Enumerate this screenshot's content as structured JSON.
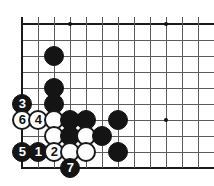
{
  "figure": {
    "kind": "go-board-diagram",
    "title": "",
    "width": 214,
    "height": 186
  },
  "board": {
    "visible_columns": 12,
    "visible_rows": 10,
    "column_x": [
      22,
      38,
      54,
      70,
      86,
      102,
      118,
      134,
      150,
      166,
      182,
      198
    ],
    "row_y": [
      24,
      40,
      56,
      72,
      88,
      104,
      120,
      136,
      152,
      168
    ],
    "spacing_px": 16,
    "line_color": "#5a5a5a",
    "edge_color": "#1a1a1a",
    "background_color": "#ffffff",
    "star_points": [
      {
        "name": "star-point-upper-left",
        "col": 3,
        "row": 0
      },
      {
        "name": "star-point-upper-right",
        "col": 9,
        "row": 0
      },
      {
        "name": "star-point-lower-right",
        "col": 9,
        "row": 6
      }
    ],
    "edges": {
      "left": true,
      "top": true,
      "bottom": true,
      "right": false
    }
  },
  "stones": [
    {
      "id": "stone-b-c3r3",
      "color": "black",
      "col": 2,
      "row": 2,
      "label": ""
    },
    {
      "id": "stone-b-c3r5",
      "color": "black",
      "col": 2,
      "row": 4,
      "label": ""
    },
    {
      "id": "stone-b-c3r6",
      "color": "black",
      "col": 2,
      "row": 5,
      "label": ""
    },
    {
      "id": "stone-b-move-3",
      "color": "black",
      "col": 0,
      "row": 5,
      "label": "3"
    },
    {
      "id": "stone-w-move-6",
      "color": "white",
      "col": 0,
      "row": 6,
      "label": "6"
    },
    {
      "id": "stone-w-move-4",
      "color": "white",
      "col": 1,
      "row": 6,
      "label": "4"
    },
    {
      "id": "stone-w-c3r7",
      "color": "white",
      "col": 2,
      "row": 6,
      "label": ""
    },
    {
      "id": "stone-b-c4r7",
      "color": "black",
      "col": 3,
      "row": 6,
      "label": ""
    },
    {
      "id": "stone-b-c5r7",
      "color": "black",
      "col": 4,
      "row": 6,
      "label": ""
    },
    {
      "id": "stone-b-c7r7",
      "color": "black",
      "col": 6,
      "row": 6,
      "label": ""
    },
    {
      "id": "stone-w-c3r8",
      "color": "white",
      "col": 2,
      "row": 7,
      "label": ""
    },
    {
      "id": "stone-b-c4r8",
      "color": "black",
      "col": 3,
      "row": 7,
      "label": ""
    },
    {
      "id": "stone-w-c5r8",
      "color": "white",
      "col": 4,
      "row": 7,
      "label": ""
    },
    {
      "id": "stone-b-c6r8",
      "color": "black",
      "col": 5,
      "row": 7,
      "label": ""
    },
    {
      "id": "stone-b-move-5",
      "color": "black",
      "col": 0,
      "row": 8,
      "label": "5"
    },
    {
      "id": "stone-b-move-1",
      "color": "black",
      "col": 1,
      "row": 8,
      "label": "1"
    },
    {
      "id": "stone-w-move-2",
      "color": "white",
      "col": 2,
      "row": 8,
      "label": "2"
    },
    {
      "id": "stone-w-c4r9",
      "color": "white",
      "col": 3,
      "row": 8,
      "label": ""
    },
    {
      "id": "stone-w-c5r9",
      "color": "white",
      "col": 4,
      "row": 8,
      "label": ""
    },
    {
      "id": "stone-b-c7r9",
      "color": "black",
      "col": 6,
      "row": 8,
      "label": ""
    },
    {
      "id": "stone-b-move-7",
      "color": "black",
      "col": 3,
      "row": 9,
      "label": "7"
    }
  ],
  "move_numbers": [
    "1",
    "2",
    "3",
    "4",
    "5",
    "6",
    "7"
  ],
  "colors": {
    "black_stone": "#141414",
    "white_stone": "#ffffff",
    "white_stone_outline": "#1a1a1a",
    "grid": "#5a5a5a",
    "edge": "#1a1a1a",
    "board_background": "#ffffff",
    "black_label_text": "#ffffff",
    "white_label_text": "#111111"
  }
}
